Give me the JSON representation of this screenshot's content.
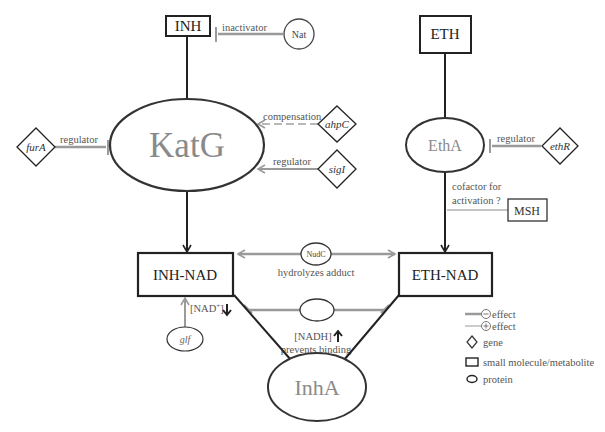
{
  "colors": {
    "dark": "#222222",
    "gray": "#9a9a9a",
    "label": "#555555",
    "enzyme_text": "#8a8a8a",
    "background": "#ffffff"
  },
  "nodes": {
    "inh": {
      "label": "INH",
      "type": "small molecule/metabolite"
    },
    "eth": {
      "label": "ETH",
      "type": "small molecule/metabolite"
    },
    "nat": {
      "label": "Nat",
      "type": "protein"
    },
    "katg": {
      "label": "KatG",
      "type": "protein"
    },
    "etha": {
      "label": "EthA",
      "type": "protein"
    },
    "fura": {
      "label": "furA",
      "type": "gene"
    },
    "ahpc": {
      "label": "ahpC",
      "type": "gene"
    },
    "sigi": {
      "label": "sigI",
      "type": "gene"
    },
    "ethr": {
      "label": "ethR",
      "type": "gene"
    },
    "msh": {
      "label": "MSH",
      "type": "small molecule/metabolite"
    },
    "inh_nad": {
      "label": "INH-NAD",
      "type": "small molecule/metabolite"
    },
    "eth_nad": {
      "label": "ETH-NAD",
      "type": "small molecule/metabolite"
    },
    "nudc": {
      "label": "NudC",
      "type": "protein"
    },
    "unnamed_protein": {
      "label": "",
      "type": "protein"
    },
    "glf": {
      "label": "glf",
      "type": "protein"
    },
    "inha": {
      "label": "InhA",
      "type": "protein"
    }
  },
  "edges": {
    "nat_inh": {
      "label": "inactivator",
      "effect": "negative"
    },
    "fura_katg": {
      "label": "regulator",
      "effect": "negative"
    },
    "ahpc_katg": {
      "label": "compensation",
      "effect": "positive",
      "style": "dashed"
    },
    "sigi_katg": {
      "label": "regulator",
      "effect": "positive"
    },
    "ethr_etha": {
      "label": "regulator",
      "effect": "negative"
    },
    "msh_etha": {
      "label_line1": "cofactor for",
      "label_line2": "activation ?",
      "effect": "positive"
    },
    "nudc_adducts": {
      "label": "hydrolyzes adduct"
    },
    "nadh_block": {
      "label_line1": "[NADH]",
      "label_line2": "prevents binding",
      "arrow": "up"
    },
    "glf_inhnad": {
      "label": "[NAD",
      "superscript": "+",
      "label_end": "]",
      "arrow": "down"
    }
  },
  "legend": {
    "items": [
      {
        "symbol": "line-dark",
        "sign": "⊖",
        "label": "effect"
      },
      {
        "symbol": "line-gray",
        "sign": "⊕",
        "label": "effect"
      },
      {
        "symbol": "diamond",
        "label": "gene"
      },
      {
        "symbol": "rectangle",
        "label": "small molecule/metabolite"
      },
      {
        "symbol": "ellipse",
        "label": "protein"
      }
    ]
  }
}
